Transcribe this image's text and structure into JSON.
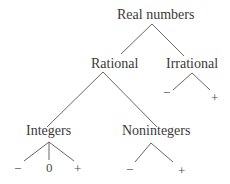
{
  "diagram": {
    "nodes": {
      "root": "Real numbers",
      "rational": "Rational",
      "irrational": "Irrational",
      "integers": "Integers",
      "nonintegers": "Nonintegers",
      "irrational_neg": "−",
      "irrational_pos": "+",
      "integers_neg": "−",
      "integers_zero": "0",
      "integers_pos": "+",
      "nonintegers_neg": "−",
      "nonintegers_pos": "+"
    },
    "edges": [
      [
        "Real numbers",
        "Rational"
      ],
      [
        "Real numbers",
        "Irrational"
      ],
      [
        "Rational",
        "Integers"
      ],
      [
        "Rational",
        "Nonintegers"
      ],
      [
        "Irrational",
        "−"
      ],
      [
        "Irrational",
        "+"
      ],
      [
        "Integers",
        "−"
      ],
      [
        "Integers",
        "0"
      ],
      [
        "Integers",
        "+"
      ],
      [
        "Nonintegers",
        "−"
      ],
      [
        "Nonintegers",
        "+"
      ]
    ],
    "line_color": "#555555",
    "text_color": "#3a3a3a"
  }
}
